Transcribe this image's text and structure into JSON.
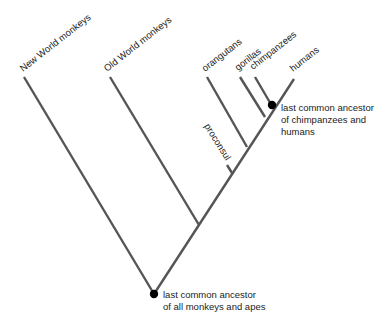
{
  "diagram": {
    "type": "cladogram",
    "colors": {
      "branch": "#555555",
      "node": "#000000",
      "text": "#222222"
    },
    "taxa": [
      {
        "id": "new-world-monkeys",
        "label": "New World monkeys"
      },
      {
        "id": "old-world-monkeys",
        "label": "Old World monkeys"
      },
      {
        "id": "orangutans",
        "label": "orangutans"
      },
      {
        "id": "gorillas",
        "label": "gorillas"
      },
      {
        "id": "chimpanzees",
        "label": "chimpanzees"
      },
      {
        "id": "humans",
        "label": "humans"
      }
    ],
    "fossil": {
      "id": "proconsul",
      "label": "proconsul"
    },
    "nodes": {
      "root": {
        "line1": "last common ancestor",
        "line2": "of all monkeys and apes"
      },
      "chimp_human": {
        "line1": "last common ancestor",
        "line2": "of chimpanzees and",
        "line3": "humans"
      }
    }
  }
}
